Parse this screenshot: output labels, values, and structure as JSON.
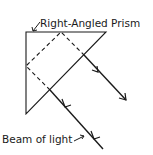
{
  "diagram": {
    "type": "optics",
    "labels": {
      "prism": "Right-Angled Prism",
      "beam": "Beam of light"
    },
    "prism": {
      "shape": "right-isosceles-triangle",
      "vertices": [
        [
          26,
          32
        ],
        [
          106,
          32
        ],
        [
          26,
          114
        ]
      ]
    },
    "beam_path": {
      "incoming": [
        [
          103,
          149
        ],
        [
          50,
          90
        ]
      ],
      "inside": [
        [
          50,
          90
        ],
        [
          26,
          66
        ],
        [
          61,
          32
        ],
        [
          84,
          55
        ]
      ],
      "outgoing": [
        [
          84,
          55
        ],
        [
          126,
          100
        ]
      ]
    },
    "colors": {
      "line": "#1a1a1a",
      "background": "#ffffff"
    }
  }
}
